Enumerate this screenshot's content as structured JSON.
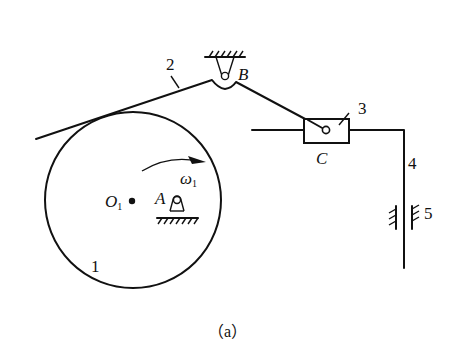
{
  "figure": {
    "caption": "（a）"
  },
  "labels": {
    "link1": "1",
    "link2": "2",
    "link3": "3",
    "link4": "4",
    "link5": "5",
    "pointA": "A",
    "pointB": "B",
    "pointC": "C",
    "center": "O",
    "center_sub": "1",
    "omega": "ω",
    "omega_sub": "1"
  },
  "components": [
    {
      "id": "1",
      "name": "circular cam (disc)",
      "center": "O1"
    },
    {
      "id": "2",
      "name": "rocker link pivoted at B"
    },
    {
      "id": "3",
      "name": "slider at C"
    },
    {
      "id": "4",
      "name": "L-shaped output rod"
    },
    {
      "id": "5",
      "name": "vertical guide (frame)"
    }
  ],
  "colors": {
    "stroke": "#111111",
    "background": "#ffffff"
  }
}
